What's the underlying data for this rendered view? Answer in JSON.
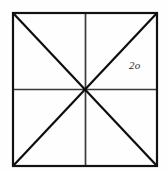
{
  "figure": {
    "canvas": {
      "width": 168,
      "height": 172,
      "background": "#fefefe"
    },
    "colors": {
      "outline": "#111111",
      "median": "#3a3a3a",
      "diagonal": "#0d0d0d",
      "label_text": "#262626"
    },
    "square": {
      "name": "outer-square",
      "left": 13,
      "top": 13,
      "right": 157,
      "bottom": 166,
      "width": 144,
      "height": 153,
      "stroke_width": 2.2
    },
    "center_point": {
      "x": 85.5,
      "y": 89.5
    },
    "medians": [
      {
        "name": "vertical-median",
        "x1": 85.5,
        "y1": 13,
        "x2": 85.5,
        "y2": 166,
        "stroke_width": 1.7
      },
      {
        "name": "horizontal-median",
        "x1": 13,
        "y1": 89.5,
        "x2": 157,
        "y2": 89.5,
        "stroke_width": 1.7
      }
    ],
    "diagonals": [
      {
        "name": "diagonal-tl-br",
        "x1": 13,
        "y1": 13,
        "x2": 157,
        "y2": 166,
        "stroke_width": 2.2
      },
      {
        "name": "diagonal-tr-bl",
        "x1": 157,
        "y1": 13,
        "x2": 13,
        "y2": 166,
        "stroke_width": 2.2
      }
    ],
    "labels": [
      {
        "name": "angle-label-2o",
        "text": "2o",
        "x": 129,
        "y": 60,
        "quadrant": "upper-right",
        "style": "italic-serif"
      }
    ]
  }
}
